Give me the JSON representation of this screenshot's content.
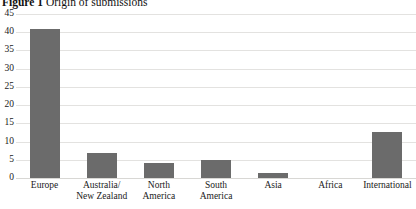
{
  "title": {
    "figure_number": "Figure 1",
    "text": "Origin of submissions"
  },
  "chart_data": {
    "type": "bar",
    "title": "Figure 1 Origin of submissions",
    "xlabel": "",
    "ylabel": "",
    "ylim": [
      0,
      45
    ],
    "yticks": [
      0,
      5,
      10,
      15,
      20,
      25,
      30,
      35,
      40,
      45
    ],
    "grid": true,
    "legend": false,
    "bar_color": "#6b6b6b",
    "categories": [
      "Europe",
      "Australia/\nNew Zealand",
      "North\nAmerica",
      "South\nAmerica",
      "Asia",
      "Africa",
      "International"
    ],
    "values": [
      41,
      7,
      4,
      5,
      1.5,
      0,
      12.5
    ]
  },
  "y_axis": {
    "ticks": [
      "45",
      "40",
      "35",
      "30",
      "25",
      "20",
      "15",
      "10",
      "5",
      "0"
    ]
  },
  "x_axis": {
    "labels": [
      {
        "line1": "Europe",
        "line2": ""
      },
      {
        "line1": "Australia/",
        "line2": "New Zealand"
      },
      {
        "line1": "North",
        "line2": "America"
      },
      {
        "line1": "South",
        "line2": "America"
      },
      {
        "line1": "Asia",
        "line2": ""
      },
      {
        "line1": "Africa",
        "line2": ""
      },
      {
        "line1": "International",
        "line2": ""
      }
    ]
  }
}
